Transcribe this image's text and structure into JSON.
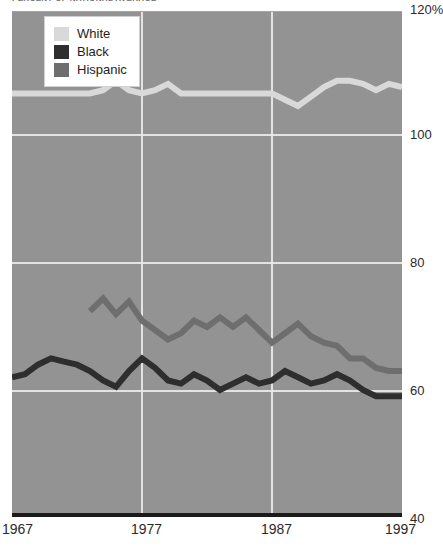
{
  "title": "PERCENT OF NATIONAL AVERAGE",
  "legend": {
    "position": "top-left-inside",
    "items": [
      {
        "label": "White",
        "color": "#d9d9d9",
        "name": "legend-swatch-white"
      },
      {
        "label": "Black",
        "color": "#2e2e2e",
        "name": "legend-swatch-black"
      },
      {
        "label": "Hispanic",
        "color": "#6e6e6e",
        "name": "legend-swatch-hispanic"
      }
    ]
  },
  "axes": {
    "y_ticks": [
      "120%",
      "100",
      "80",
      "60",
      "40"
    ],
    "y_values": [
      120,
      100,
      80,
      60,
      40
    ],
    "x_ticks": [
      "1967",
      "1977",
      "1987",
      "1997"
    ],
    "x_values": [
      1967,
      1977,
      1987,
      1997
    ]
  },
  "colors": {
    "plot_background": "#939393",
    "gridline": "#e9e9e9",
    "axis": "#1b1b1b",
    "white_series": "#d9d9d9",
    "black_series": "#2e2e2e",
    "hispanic_series": "#6e6e6e"
  },
  "chart_data": {
    "type": "line",
    "title": "PERCENT OF NATIONAL AVERAGE",
    "xlabel": "",
    "ylabel": "",
    "xlim": [
      1967,
      1997
    ],
    "ylim": [
      40,
      120
    ],
    "grid": true,
    "legend_position": "top-left",
    "x": [
      1967,
      1968,
      1969,
      1970,
      1971,
      1972,
      1973,
      1974,
      1975,
      1976,
      1977,
      1978,
      1979,
      1980,
      1981,
      1982,
      1983,
      1984,
      1985,
      1986,
      1987,
      1988,
      1989,
      1990,
      1991,
      1992,
      1993,
      1994,
      1995,
      1996,
      1997
    ],
    "series": [
      {
        "name": "White",
        "color": "#d9d9d9",
        "values": [
          106.5,
          106.5,
          106.5,
          106.5,
          106.5,
          106.5,
          106.5,
          107.0,
          108.5,
          107.0,
          106.5,
          107.0,
          108.0,
          106.5,
          106.5,
          106.5,
          106.5,
          106.5,
          106.5,
          106.5,
          106.5,
          105.5,
          104.5,
          106.0,
          107.5,
          108.5,
          108.5,
          108.0,
          107.0,
          108.0,
          107.5
        ]
      },
      {
        "name": "Black",
        "color": "#2e2e2e",
        "values": [
          61.5,
          62.0,
          63.5,
          64.5,
          64.0,
          63.5,
          62.5,
          61.0,
          60.0,
          62.5,
          64.5,
          63.0,
          61.0,
          60.5,
          62.0,
          61.0,
          59.5,
          60.5,
          61.5,
          60.5,
          61.0,
          62.5,
          61.5,
          60.5,
          61.0,
          62.0,
          61.0,
          59.5,
          58.5,
          58.5,
          58.5
        ]
      },
      {
        "name": "Hispanic",
        "color": "#6e6e6e",
        "values": [
          null,
          null,
          null,
          null,
          null,
          null,
          72.0,
          74.0,
          71.5,
          73.5,
          70.5,
          69.0,
          67.5,
          68.5,
          70.5,
          69.5,
          71.0,
          69.5,
          71.0,
          69.0,
          67.0,
          68.5,
          70.0,
          68.0,
          67.0,
          66.5,
          64.5,
          64.5,
          63.0,
          62.5,
          62.5
        ]
      }
    ]
  }
}
